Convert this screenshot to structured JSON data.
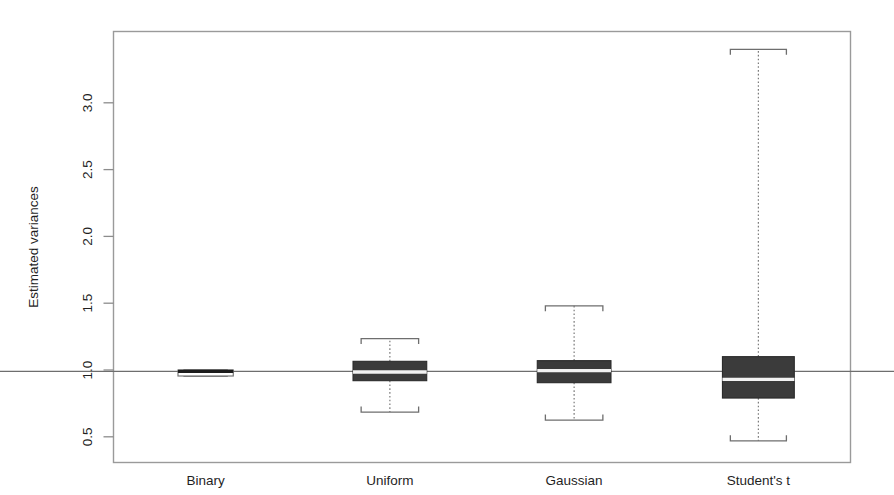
{
  "chart_data": {
    "type": "box",
    "title": "",
    "xlabel": "",
    "ylabel": "Estimated variances",
    "ylim": [
      0.3,
      3.52
    ],
    "grid": false,
    "legend": "none",
    "reference_line": {
      "label": "y = 1",
      "value": 0.99
    },
    "categories": [
      "Binary",
      "Uniform",
      "Gaussian",
      "Student's t"
    ],
    "ytick_labels": [
      "0.5",
      "1.0",
      "1.5",
      "2.0",
      "2.5",
      "3.0"
    ],
    "ytick_values": [
      0.5,
      1.0,
      1.5,
      2.0,
      2.5,
      3.0
    ],
    "boxes": [
      {
        "name": "Binary",
        "fill": "open",
        "whisker_low": 0.955,
        "q1": 0.955,
        "median": 0.99,
        "q3": 1.0,
        "whisker_high": 1.0,
        "box_width_frac": 0.3
      },
      {
        "name": "Uniform",
        "fill": "filled",
        "whisker_low": 0.685,
        "q1": 0.92,
        "median": 0.985,
        "q3": 1.065,
        "whisker_high": 1.235,
        "box_width_frac": 0.4
      },
      {
        "name": "Gaussian",
        "fill": "filled",
        "whisker_low": 0.625,
        "q1": 0.905,
        "median": 0.995,
        "q3": 1.07,
        "whisker_high": 1.48,
        "box_width_frac": 0.4
      },
      {
        "name": "Student's t",
        "fill": "filled",
        "whisker_low": 0.47,
        "q1": 0.79,
        "median": 0.93,
        "q3": 1.1,
        "whisker_high": 3.4,
        "box_width_frac": 0.39
      }
    ]
  },
  "axes": {
    "y_title": "Estimated variances"
  }
}
